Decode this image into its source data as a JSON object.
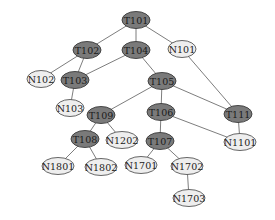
{
  "diagram": {
    "type": "tree",
    "colors": {
      "task_node": "#7a7a7a",
      "leaf_node": "#eeeeee",
      "edge": "#6e6e6e"
    },
    "nodes": [
      {
        "id": "T101",
        "label": "T101",
        "kind": "dark",
        "x": 136,
        "y": 20,
        "w": 28
      },
      {
        "id": "T102",
        "label": "T102",
        "kind": "dark",
        "x": 87,
        "y": 50,
        "w": 28
      },
      {
        "id": "T104",
        "label": "T104",
        "kind": "dark",
        "x": 136,
        "y": 50,
        "w": 28
      },
      {
        "id": "N101",
        "label": "N101",
        "kind": "light",
        "x": 182,
        "y": 49,
        "w": 28
      },
      {
        "id": "N102",
        "label": "N102",
        "kind": "light",
        "x": 41,
        "y": 79,
        "w": 28
      },
      {
        "id": "T103",
        "label": "T103",
        "kind": "dark",
        "x": 75,
        "y": 80,
        "w": 28
      },
      {
        "id": "T105",
        "label": "T105",
        "kind": "dark",
        "x": 162,
        "y": 81,
        "w": 28
      },
      {
        "id": "N103",
        "label": "N103",
        "kind": "light",
        "x": 70,
        "y": 108,
        "w": 28
      },
      {
        "id": "T109",
        "label": "T109",
        "kind": "dark",
        "x": 101,
        "y": 115,
        "w": 28
      },
      {
        "id": "T106",
        "label": "T106",
        "kind": "dark",
        "x": 161,
        "y": 112,
        "w": 28
      },
      {
        "id": "T111",
        "label": "T111",
        "kind": "dark",
        "x": 238,
        "y": 114,
        "w": 28
      },
      {
        "id": "T108",
        "label": "T108",
        "kind": "dark",
        "x": 85,
        "y": 139,
        "w": 28
      },
      {
        "id": "N1202",
        "label": "N1202",
        "kind": "light",
        "x": 122,
        "y": 140,
        "w": 32
      },
      {
        "id": "T107",
        "label": "T107",
        "kind": "dark",
        "x": 160,
        "y": 141,
        "w": 28
      },
      {
        "id": "N1101",
        "label": "N1101",
        "kind": "light",
        "x": 240,
        "y": 142,
        "w": 32
      },
      {
        "id": "N1801",
        "label": "N1801",
        "kind": "light",
        "x": 58,
        "y": 166,
        "w": 32
      },
      {
        "id": "N1802",
        "label": "N1802",
        "kind": "light",
        "x": 101,
        "y": 167,
        "w": 32
      },
      {
        "id": "N1701",
        "label": "N1701",
        "kind": "light",
        "x": 141,
        "y": 165,
        "w": 32
      },
      {
        "id": "N1702",
        "label": "N1702",
        "kind": "light",
        "x": 187,
        "y": 166,
        "w": 32
      },
      {
        "id": "N1703",
        "label": "N1703",
        "kind": "light",
        "x": 189,
        "y": 198,
        "w": 32
      }
    ],
    "edges": [
      [
        "T101",
        "T102"
      ],
      [
        "T101",
        "T104"
      ],
      [
        "T101",
        "N101"
      ],
      [
        "T102",
        "N102"
      ],
      [
        "T102",
        "T103"
      ],
      [
        "T104",
        "T103"
      ],
      [
        "T104",
        "T105"
      ],
      [
        "N101",
        "T111"
      ],
      [
        "T103",
        "N103"
      ],
      [
        "T105",
        "T109"
      ],
      [
        "T105",
        "T106"
      ],
      [
        "T105",
        "T111"
      ],
      [
        "T106",
        "T107"
      ],
      [
        "T106",
        "N1101"
      ],
      [
        "T111",
        "N1101"
      ],
      [
        "T109",
        "T108"
      ],
      [
        "T109",
        "N1202"
      ],
      [
        "T108",
        "N1801"
      ],
      [
        "T108",
        "N1802"
      ],
      [
        "T107",
        "N1701"
      ],
      [
        "T107",
        "N1702"
      ],
      [
        "N1702",
        "N1703"
      ]
    ]
  }
}
